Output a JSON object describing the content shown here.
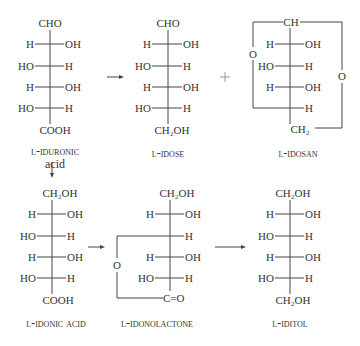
{
  "structures": {
    "iduronic": {
      "name_line1": "l-iduronic",
      "name_line2": "acid",
      "top": "CHO",
      "bottom": "COOH",
      "rows": [
        {
          "left": "H",
          "right": "OH"
        },
        {
          "left": "HO",
          "right": "H"
        },
        {
          "left": "H",
          "right": "OH"
        },
        {
          "left": "HO",
          "right": "H"
        }
      ]
    },
    "idose": {
      "name": "l-idose",
      "top": "CHO",
      "bottom": "CH₂OH",
      "rows": [
        {
          "left": "H",
          "right": "OH"
        },
        {
          "left": "HO",
          "right": "H"
        },
        {
          "left": "H",
          "right": "OH"
        },
        {
          "left": "HO",
          "right": "H"
        }
      ]
    },
    "idosan": {
      "name": "l-idosan",
      "top": "CH",
      "bottom": "CH₂",
      "ring_o_left": "O",
      "ring_o_right": "O",
      "rows": [
        {
          "left": "H",
          "right": "OH"
        },
        {
          "left": "HO",
          "right": "H"
        },
        {
          "left": "H",
          "right": "OH"
        },
        {
          "left": "",
          "right": "H"
        }
      ]
    },
    "idonic": {
      "name": "l-idonic acid",
      "top": "CH₂OH",
      "bottom": "COOH",
      "rows": [
        {
          "left": "H",
          "right": "OH"
        },
        {
          "left": "HO",
          "right": "H"
        },
        {
          "left": "H",
          "right": "OH"
        },
        {
          "left": "HO",
          "right": "H"
        }
      ]
    },
    "idonolactone": {
      "name": "l-idonolactone",
      "top": "CH₂OH",
      "bottom": "C=O",
      "ring_o": "O",
      "rows": [
        {
          "left": "H",
          "right": "OH"
        },
        {
          "left": "",
          "right": "H"
        },
        {
          "left": "H",
          "right": "OH"
        },
        {
          "left": "HO",
          "right": "H"
        }
      ]
    },
    "iditol": {
      "name": "l-iditol",
      "top": "CH₂OH",
      "bottom": "CH₂OH",
      "rows": [
        {
          "left": "H",
          "right": "OH"
        },
        {
          "left": "HO",
          "right": "H"
        },
        {
          "left": "H",
          "right": "OH"
        },
        {
          "left": "HO",
          "right": "H"
        }
      ]
    }
  },
  "symbols": {
    "arrow_right": "→",
    "arrow_down": "↓",
    "plus": "+"
  },
  "colors": {
    "ink": "#333333",
    "background": "#ffffff"
  }
}
